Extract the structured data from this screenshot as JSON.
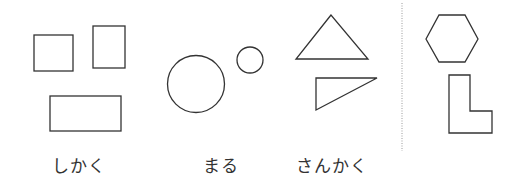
{
  "groups": [
    {
      "label": "しかく",
      "shapes": [
        "square",
        "rectangle-tall",
        "rectangle-wide"
      ]
    },
    {
      "label": "まる",
      "shapes": [
        "circle-large",
        "circle-small"
      ]
    },
    {
      "label": "さんかく",
      "shapes": [
        "triangle-isosceles",
        "triangle-right"
      ]
    }
  ],
  "unclassified": {
    "shapes": [
      "hexagon",
      "l-shape"
    ]
  },
  "colors": {
    "stroke": "#333333",
    "divider": "#9a9a9a",
    "background": "#ffffff"
  }
}
